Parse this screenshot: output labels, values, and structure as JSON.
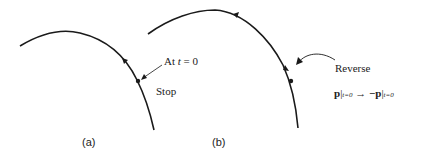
{
  "panel_a": {
    "label": "(a)",
    "annotation_prefix": "At ",
    "annotation_var": "t",
    "annotation_suffix": " = 0",
    "stop_label": "Stop"
  },
  "panel_b": {
    "label": "(b)",
    "reverse_label": "Reverse",
    "equation": {
      "lhs": "p",
      "lhs_sub": "t=0",
      "arrow": "→",
      "rhs": "−p",
      "rhs_sub": "t=0"
    }
  },
  "colors": {
    "stroke": "#1a1a1a",
    "text": "#222222"
  }
}
